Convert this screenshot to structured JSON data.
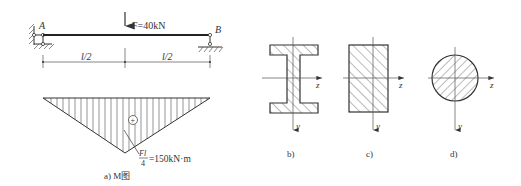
{
  "beam": {
    "left_support_label": "A",
    "right_support_label": "B",
    "force_label": "F=40kN",
    "span_left_label": "l/2",
    "span_right_label": "l/2"
  },
  "moment_diagram": {
    "sign": "+",
    "max_label_numerator": "Fl",
    "max_label_denominator": "4",
    "max_label_value": "=150kN·m",
    "caption": "a) M图"
  },
  "sections": [
    {
      "id": "b",
      "shape": "I-beam",
      "caption": "b)",
      "axis_z": "z",
      "axis_y": "y"
    },
    {
      "id": "c",
      "shape": "rectangle",
      "caption": "c)",
      "axis_z": "z",
      "axis_y": "y"
    },
    {
      "id": "d",
      "shape": "circle",
      "caption": "d)",
      "axis_z": "z",
      "axis_y": "y"
    }
  ],
  "colors": {
    "line": "#333333",
    "hatch": "#555555",
    "background": "#ffffff"
  }
}
